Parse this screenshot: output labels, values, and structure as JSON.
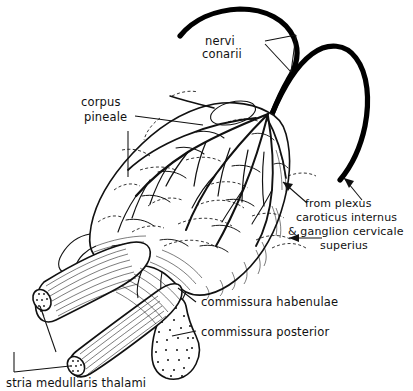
{
  "figure": {
    "background_color": "#ffffff",
    "ink_color": "#111111",
    "width": 413,
    "height": 391
  },
  "labels": {
    "nervi_conarii": {
      "line1": "nervi",
      "line2": "conarii"
    },
    "corpus_pineale": {
      "line1": "corpus",
      "line2": "pineale"
    },
    "from_plexus": {
      "line1": "from plexus",
      "line2": "caroticus internus",
      "line3": "& ganglion cervicale",
      "line4": "superius"
    },
    "commissura_habenulae": "commissura habenulae",
    "commissura_posterior": "commissura posterior",
    "stria_medullaris_thalami": "stria medullaris thalami"
  },
  "structures": [
    {
      "name": "corpus-pineale",
      "kind": "gland",
      "description": "elongated ovoid pineal body with dense plexus of nerve fibres"
    },
    {
      "name": "nervi-conarii",
      "kind": "nerve",
      "description": "two thick pineal nerve cords arching from the gland apex"
    },
    {
      "name": "commissura-habenulae",
      "kind": "commissure",
      "description": "habenular commissure at the antero-superior base"
    },
    {
      "name": "commissura-posterior",
      "kind": "commissure",
      "description": "stippled posterior commissure below the gland base"
    },
    {
      "name": "stria-medullaris-thalami",
      "kind": "tract",
      "description": "two cut striated bands with stippled cut faces"
    }
  ],
  "arrows": [
    {
      "name": "arrow-upper",
      "direction": "up-left"
    },
    {
      "name": "arrow-right",
      "direction": "up-left"
    },
    {
      "name": "arrow-lateral",
      "direction": "left"
    }
  ]
}
